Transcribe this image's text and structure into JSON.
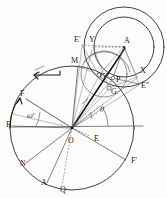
{
  "figure": {
    "background_color": "#fdfdfd",
    "ink_color": "#1a1a1a",
    "width": 167,
    "height": 198
  },
  "labels": {
    "center_O": "O",
    "apex_A": "A",
    "point_M": "M",
    "point_F": "F",
    "point_B": "B",
    "point_N": "N",
    "point_A_prime": "A",
    "point_Q": "Q",
    "point_F_prime": "F'",
    "point_E": "E",
    "point_E_prime": "E'",
    "point_E_double_prime": "E″",
    "point_Y": "Y",
    "point_X": "X",
    "point_G": "G",
    "point_G_prime": "G'",
    "point_P": "P",
    "angle_omega_prime": "ω'",
    "angle_theta": "θ"
  },
  "label_positions": [
    {
      "name": "point-E-prime",
      "text": "E'",
      "x": 74,
      "y": 42,
      "class": "dlabel"
    },
    {
      "name": "point-Y",
      "text": "Y",
      "x": 89,
      "y": 42,
      "class": "dlabel"
    },
    {
      "name": "apex-A",
      "text": "A",
      "x": 124,
      "y": 43,
      "class": "dlabel"
    },
    {
      "name": "point-M",
      "text": "M",
      "x": 71,
      "y": 63,
      "class": "dlabel"
    },
    {
      "name": "point-X",
      "text": "X",
      "x": 140,
      "y": 73,
      "class": "dlabel"
    },
    {
      "name": "point-G-prime",
      "text": "G'",
      "x": 100,
      "y": 79,
      "class": "dlabel"
    },
    {
      "name": "point-P",
      "text": "P",
      "x": 116,
      "y": 82,
      "class": "dlabel"
    },
    {
      "name": "point-E-double-prime",
      "text": "E″",
      "x": 141,
      "y": 88,
      "class": "dlabel"
    },
    {
      "name": "point-G",
      "text": "G",
      "x": 111,
      "y": 94,
      "class": "dlabel"
    },
    {
      "name": "point-F",
      "text": "F",
      "x": 20,
      "y": 96,
      "class": "dlabel"
    },
    {
      "name": "angle-theta",
      "text": "θ",
      "x": 100,
      "y": 112,
      "class": "dlabel-greek"
    },
    {
      "name": "angle-omega-prime",
      "text": "ω'",
      "x": 27,
      "y": 118,
      "class": "dlabel-greek"
    },
    {
      "name": "point-B",
      "text": "B",
      "x": 6,
      "y": 127,
      "class": "dlabel"
    },
    {
      "name": "center-O",
      "text": "O",
      "x": 68,
      "y": 143,
      "class": "dlabel"
    },
    {
      "name": "point-E",
      "text": "E",
      "x": 94,
      "y": 141,
      "class": "dlabel"
    },
    {
      "name": "point-N",
      "text": "N",
      "x": 20,
      "y": 166,
      "class": "dlabel"
    },
    {
      "name": "point-F-prime",
      "text": "F'",
      "x": 131,
      "y": 163,
      "class": "dlabel"
    },
    {
      "name": "point-A-prime",
      "text": "A",
      "x": 41,
      "y": 185,
      "class": "dlabel"
    },
    {
      "name": "point-Q",
      "text": "Q",
      "x": 60,
      "y": 192,
      "class": "dlabel"
    }
  ],
  "geometry": {
    "main_circle": {
      "cx": 72,
      "cy": 128,
      "r": 62
    },
    "circle_A_outer": {
      "cx": 124,
      "cy": 47,
      "r": 40
    },
    "circle_A_inner": {
      "cx": 124,
      "cy": 47,
      "r": 30
    },
    "circle_small": {
      "cx": 105,
      "cy": 73,
      "r": 22
    },
    "points": {
      "O": {
        "x": 72,
        "y": 128
      },
      "A": {
        "x": 124,
        "y": 47
      },
      "M": {
        "x": 78,
        "y": 66
      },
      "F": {
        "x": 26,
        "y": 99
      },
      "B": {
        "x": 13,
        "y": 126
      },
      "N": {
        "x": 26,
        "y": 163
      },
      "Ap": {
        "x": 47,
        "y": 183
      },
      "Q": {
        "x": 62,
        "y": 186
      },
      "Fp": {
        "x": 126,
        "y": 160
      },
      "E": {
        "x": 90,
        "y": 136
      },
      "Ep": {
        "x": 82,
        "y": 45
      },
      "Y": {
        "x": 95,
        "y": 47
      },
      "X": {
        "x": 137,
        "y": 77
      },
      "Epp": {
        "x": 139,
        "y": 84
      },
      "G": {
        "x": 109,
        "y": 88
      },
      "Gp": {
        "x": 99,
        "y": 75
      },
      "P": {
        "x": 113,
        "y": 78
      }
    }
  }
}
